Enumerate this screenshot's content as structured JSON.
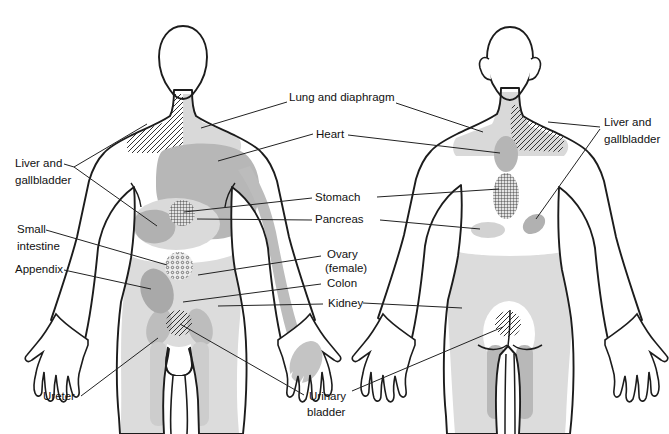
{
  "labels": {
    "liver_front": {
      "line1": "Liver and",
      "line2": "gallbladder"
    },
    "small_intestine": {
      "line1": "Small",
      "line2": "intestine"
    },
    "appendix": "Appendix",
    "ureter": "Ureter",
    "lung": "Lung and diaphragm",
    "heart": "Heart",
    "stomach": "Stomach",
    "pancreas": "Pancreas",
    "ovary": {
      "line1": "Ovary",
      "line2": "(female)"
    },
    "colon": "Colon",
    "kidney": "Kidney",
    "bladder": {
      "line1": "Urinary",
      "line2": "bladder"
    },
    "liver_back": {
      "line1": "Liver and",
      "line2": "gallbladder"
    }
  },
  "colors": {
    "outline": "#1c1c1c",
    "leader_line": "#222222",
    "light_gray": "#d9d9d9",
    "medium_gray": "#b5b5b5",
    "dark_gray": "#a7a7a7",
    "hatch": "#333333",
    "background": "#ffffff",
    "label_text": "#111111"
  },
  "regions": [
    {
      "name": "lung-and-diaphragm",
      "figure": "front and back",
      "style": "light-gray with diagonal-hatch shoulder"
    },
    {
      "name": "heart",
      "figure": "front chest, left arm, upper back",
      "style": "medium-gray"
    },
    {
      "name": "liver-gallbladder",
      "figure": "front and back",
      "style": "diagonal-hatch shoulder + medium-gray patch"
    },
    {
      "name": "stomach",
      "figure": "front and back",
      "style": "fine grid crosshatch"
    },
    {
      "name": "pancreas",
      "figure": "front and back",
      "style": "light-gray"
    },
    {
      "name": "small-intestine",
      "figure": "front",
      "style": "stippled dots"
    },
    {
      "name": "appendix",
      "figure": "front",
      "style": "medium-gray"
    },
    {
      "name": "ovary-colon-kidney",
      "figure": "front and back lower trunk",
      "style": "light-gray"
    },
    {
      "name": "ureter",
      "figure": "front groin, back inner thigh",
      "style": "medium-gray"
    },
    {
      "name": "urinary-bladder",
      "figure": "front pubis and sacrum",
      "style": "diagonal-hatch circle"
    }
  ]
}
